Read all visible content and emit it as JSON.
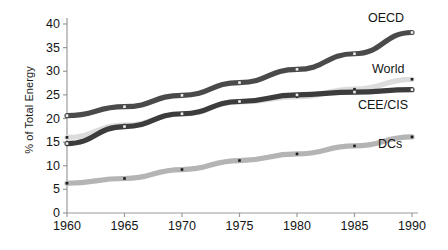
{
  "chart_data": {
    "type": "line",
    "title": "",
    "xlabel": "",
    "ylabel": "% of Total Energy",
    "categories": [
      "1960",
      "1965",
      "1970",
      "1975",
      "1980",
      "1985",
      "1990"
    ],
    "x": [
      1960,
      1965,
      1970,
      1975,
      1980,
      1985,
      1990
    ],
    "xlim": [
      1960,
      1990
    ],
    "ylim": [
      0,
      40
    ],
    "y_ticks": [
      "0",
      "5",
      "10",
      "15",
      "20",
      "25",
      "30",
      "35",
      "40"
    ],
    "y_tick_values": [
      0,
      5,
      10,
      15,
      20,
      25,
      30,
      35,
      40
    ],
    "grid": false,
    "legend_position": "inline-right-of-line-ends",
    "markers": "small square points",
    "series": [
      {
        "name": "OECD",
        "color": "#4a4a4a",
        "values": [
          20.6,
          22.5,
          24.9,
          27.6,
          30.4,
          33.7,
          38.2
        ]
      },
      {
        "name": "World",
        "color": "#dcdcdc",
        "values": [
          16.0,
          18.6,
          20.9,
          23.5,
          24.6,
          26.2,
          28.3
        ]
      },
      {
        "name": "CEE/CIS",
        "color": "#3c3c3c",
        "values": [
          14.7,
          18.3,
          21.0,
          23.6,
          25.0,
          25.6,
          26.1
        ]
      },
      {
        "name": "DCs",
        "color": "#b4b4b4",
        "values": [
          6.3,
          7.3,
          9.2,
          11.1,
          12.5,
          14.2,
          16.1
        ]
      }
    ]
  },
  "axis": {
    "y_title": "% of Total Energy"
  }
}
